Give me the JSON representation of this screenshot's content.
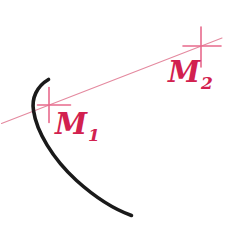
{
  "figure": {
    "canvas": {
      "width": 250,
      "height": 235,
      "background": "#ffffff"
    },
    "colors": {
      "curve": "#1a1a1a",
      "secant_line": "#e4899f",
      "cross_mark": "#e86a8c",
      "label": "#d2214f"
    },
    "curve": {
      "name": "black-arc",
      "stroke_width": 3.6,
      "path": "M 48.5 79.5 C 36.5 86.5, 31.5 98.5, 33.5 110.5 C 36.5 131.5, 52.5 158.5, 76.5 180.5 C 96.5 198.5, 117.5 210.5, 131.5 215.5",
      "endpoints": {
        "start": [
          48.5,
          79.5
        ],
        "end": [
          131.5,
          215.5
        ]
      }
    },
    "secant": {
      "name": "secant-line",
      "stroke_width": 1.1,
      "x1": 1.5,
      "y1": 123.5,
      "x2": 222.0,
      "y2": 38.0
    },
    "points": [
      {
        "id": "M1",
        "label_base": "M",
        "label_sub": "1",
        "cx": 49.0,
        "cy": 105.0,
        "cross": {
          "x1": 37.5,
          "x2": 70.5,
          "y1": 87.5,
          "y2": 122.5,
          "stroke_width": 1.6
        }
      },
      {
        "id": "M2",
        "label_base": "M",
        "label_sub": "2",
        "cx": 201.0,
        "cy": 46.0,
        "cross": {
          "x1": 183.0,
          "x2": 221.0,
          "y1": 27.0,
          "y2": 67.0,
          "stroke_width": 1.6
        }
      }
    ]
  }
}
